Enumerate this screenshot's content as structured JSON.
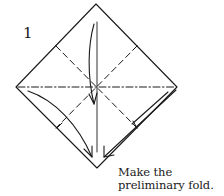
{
  "diagram": {
    "step_number": "1",
    "caption_line1": "Make the",
    "caption_line2": "preliminary fold.",
    "line_color": "#1a1a1a",
    "elements": {
      "paper_outline": "diamond-square",
      "valley_folds": [
        "diagonal-ul-lr",
        "diagonal-ur-ll"
      ],
      "mountain_folds": [
        "horizontal-center",
        "vertical-center"
      ],
      "arrows": [
        "top-to-center-arrow",
        "left-corner-to-bottom-arrow",
        "right-corner-to-bottom-arrow"
      ]
    }
  }
}
